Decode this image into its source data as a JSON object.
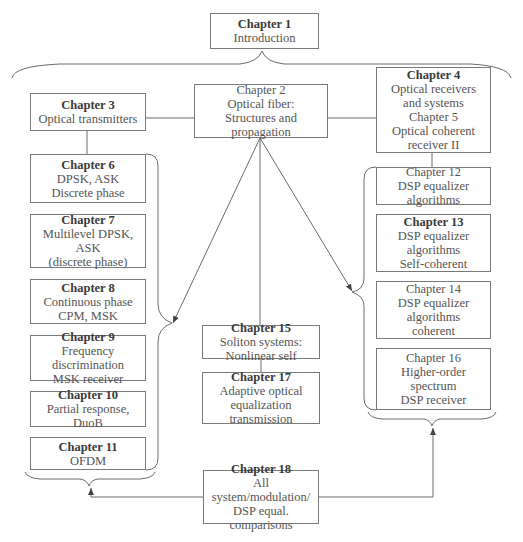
{
  "chapters": {
    "ch1": {
      "title": "Chapter 1",
      "lines": [
        "Introduction"
      ]
    },
    "ch2": {
      "title": "Chapter 2",
      "lines": [
        "Optical fiber:",
        "Structures and propagation"
      ]
    },
    "ch3": {
      "title": "Chapter 3",
      "lines": [
        "Optical transmitters"
      ]
    },
    "ch4": {
      "title": "Chapter 4",
      "lines": [
        "Optical receivers",
        "and systems"
      ]
    },
    "ch5": {
      "title": "Chapter 5",
      "lines": [
        "Optical coherent",
        "receiver II"
      ]
    },
    "ch6": {
      "title": "Chapter 6",
      "lines": [
        "DPSK, ASK",
        "Discrete phase"
      ]
    },
    "ch7": {
      "title": "Chapter 7",
      "lines": [
        "Multilevel DPSK, ASK",
        "(discrete phase)"
      ]
    },
    "ch8": {
      "title": "Chapter 8",
      "lines": [
        "Continuous phase",
        "CPM, MSK"
      ]
    },
    "ch9": {
      "title": "Chapter 9",
      "lines": [
        "Frequency discrimination",
        "MSK receiver"
      ]
    },
    "ch10": {
      "title": "Chapter 10",
      "lines": [
        "Partial response, DuoB"
      ]
    },
    "ch11": {
      "title": "Chapter 11",
      "lines": [
        "OFDM"
      ]
    },
    "ch12": {
      "title": "Chapter 12",
      "lines": [
        "DSP equalizer algorithms"
      ]
    },
    "ch13": {
      "title": "Chapter 13",
      "lines": [
        "DSP equalizer",
        "algorithms",
        "Self-coherent"
      ]
    },
    "ch14": {
      "title": "Chapter 14",
      "lines": [
        "DSP equalizer",
        "algorithms",
        "coherent"
      ]
    },
    "ch15": {
      "title": "Chapter 15",
      "lines": [
        "Soliton systems:",
        "Nonlinear self"
      ]
    },
    "ch16": {
      "title": "Chapter 16",
      "lines": [
        "Higher-order spectrum",
        "DSP receiver"
      ]
    },
    "ch17": {
      "title": "Chapter 17",
      "lines": [
        "Adaptive optical",
        "equalization transmission"
      ]
    },
    "ch18": {
      "title": "Chapter 18",
      "lines": [
        "All system/modulation/",
        "DSP equal. comparisons"
      ]
    }
  },
  "colors": {
    "line": "#6a6a6a",
    "border": "#7a7a7a",
    "text": "#555555"
  }
}
